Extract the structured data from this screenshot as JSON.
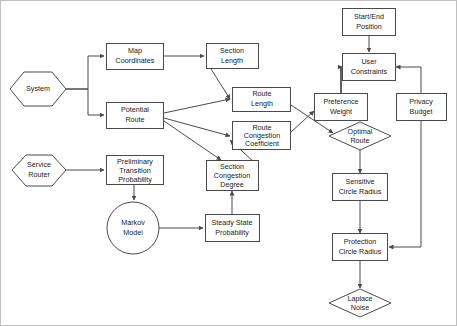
{
  "diagram": {
    "type": "flowchart",
    "background_color": "#ffffff",
    "stroke_color": "#4a4a4a",
    "text_color": "#1a1a1a",
    "border_color": "#bfbfbf",
    "nodes": [
      {
        "id": "system",
        "shape": "hexagon",
        "label": "System",
        "lines": [
          "System"
        ],
        "cx": 38,
        "cy": 89,
        "w": 56,
        "h": 34
      },
      {
        "id": "service_router",
        "shape": "hexagon",
        "label": "Service Router",
        "lines": [
          "Service",
          "Router"
        ],
        "cx": 39,
        "cy": 170,
        "w": 54,
        "h": 31
      },
      {
        "id": "map_coordinates",
        "shape": "rect",
        "label": "Map Coordinates",
        "lines": [
          "Map",
          "Coordinates"
        ],
        "cx": 135,
        "cy": 56,
        "w": 57,
        "h": 26
      },
      {
        "id": "potential_route",
        "shape": "rect",
        "label": "Potential Route",
        "lines": [
          "Potential",
          "Route"
        ],
        "cx": 135,
        "cy": 115,
        "w": 57,
        "h": 26
      },
      {
        "id": "section_length",
        "shape": "rect",
        "label": "Section Length",
        "lines": [
          "Section",
          "Length"
        ],
        "cx": 232,
        "cy": 56,
        "w": 52,
        "h": 25
      },
      {
        "id": "route_length",
        "shape": "rect",
        "label": "Route Length",
        "lines": [
          "Route",
          "Length"
        ],
        "cx": 262,
        "cy": 99,
        "w": 58,
        "h": 24
      },
      {
        "id": "route_congestion",
        "shape": "rect",
        "label": "Route Congestion Coefficient",
        "lines": [
          "Route",
          "Congestion",
          "Coefficient"
        ],
        "cx": 262,
        "cy": 136,
        "w": 58,
        "h": 28
      },
      {
        "id": "section_congestion",
        "shape": "rect",
        "label": "Section Congestion Degree",
        "lines": [
          "Section",
          "Congestion",
          "Degree"
        ],
        "cx": 232,
        "cy": 175,
        "w": 52,
        "h": 28
      },
      {
        "id": "prelim_transition",
        "shape": "rect",
        "label": "Preliminary Transition Probability",
        "lines": [
          "Preliminary",
          "Transition",
          "Probability"
        ],
        "cx": 135,
        "cy": 170,
        "w": 57,
        "h": 28
      },
      {
        "id": "markov_model",
        "shape": "circle",
        "label": "Markov Model",
        "lines": [
          "Markov",
          "Model"
        ],
        "cx": 133,
        "cy": 228,
        "w": 52,
        "h": 52
      },
      {
        "id": "steady_state",
        "shape": "rect",
        "label": "Steady State Probability",
        "lines": [
          "Steady State",
          "Probability"
        ],
        "cx": 232,
        "cy": 228,
        "w": 54,
        "h": 26
      },
      {
        "id": "start_end",
        "shape": "rect",
        "label": "Start/End Position",
        "lines": [
          "Start/End",
          "Position"
        ],
        "cx": 369,
        "cy": 22,
        "w": 52,
        "h": 27
      },
      {
        "id": "user_constraints",
        "shape": "rect",
        "label": "User Constraints",
        "lines": [
          "User",
          "Constraints"
        ],
        "cx": 369,
        "cy": 67,
        "w": 52,
        "h": 26
      },
      {
        "id": "preference_weight",
        "shape": "rect",
        "label": "Preference Weight",
        "lines": [
          "Preference",
          "Weight"
        ],
        "cx": 341,
        "cy": 107,
        "w": 53,
        "h": 26
      },
      {
        "id": "privacy_budget",
        "shape": "rect",
        "label": "Privacy Budget",
        "lines": [
          "Privacy",
          "Budget"
        ],
        "cx": 421,
        "cy": 107,
        "w": 50,
        "h": 26
      },
      {
        "id": "optimal_route",
        "shape": "diamond",
        "label": "Optimal Route",
        "lines": [
          "Optimal",
          "Route"
        ],
        "cx": 360,
        "cy": 136,
        "w": 62,
        "h": 28
      },
      {
        "id": "sensitive_radius",
        "shape": "rect",
        "label": "Sensitive Circle Radius",
        "lines": [
          "Sensitive",
          "Circle Radius"
        ],
        "cx": 360,
        "cy": 187,
        "w": 55,
        "h": 27
      },
      {
        "id": "protection_radius",
        "shape": "rect",
        "label": "Protection Circle Radius",
        "lines": [
          "Protection",
          "Circle Radius"
        ],
        "cx": 360,
        "cy": 247,
        "w": 55,
        "h": 27
      },
      {
        "id": "laplace_noise",
        "shape": "diamond",
        "label": "Laplace Noise",
        "lines": [
          "Laplace",
          "Noise"
        ],
        "cx": 360,
        "cy": 303,
        "w": 62,
        "h": 28
      }
    ],
    "edges": [
      {
        "from": "system",
        "to": "map_coordinates",
        "style": "orthogonal"
      },
      {
        "from": "system",
        "to": "potential_route",
        "style": "orthogonal"
      },
      {
        "from": "map_coordinates",
        "to": "section_length",
        "style": "straight"
      },
      {
        "from": "section_length",
        "to": "route_length",
        "style": "diagonal"
      },
      {
        "from": "potential_route",
        "to": "route_length",
        "style": "diagonal"
      },
      {
        "from": "potential_route",
        "to": "route_congestion",
        "style": "diagonal"
      },
      {
        "from": "potential_route",
        "to": "section_congestion",
        "style": "diagonal"
      },
      {
        "from": "section_congestion",
        "to": "route_congestion",
        "style": "diagonal"
      },
      {
        "from": "service_router",
        "to": "prelim_transition",
        "style": "straight"
      },
      {
        "from": "prelim_transition",
        "to": "markov_model",
        "style": "straight"
      },
      {
        "from": "markov_model",
        "to": "steady_state",
        "style": "straight"
      },
      {
        "from": "steady_state",
        "to": "section_congestion",
        "style": "straight"
      },
      {
        "from": "route_length",
        "to": "optimal_route",
        "style": "diagonal"
      },
      {
        "from": "route_congestion",
        "to": "preference_weight",
        "style": "diagonal"
      },
      {
        "from": "start_end",
        "to": "user_constraints",
        "style": "straight"
      },
      {
        "from": "preference_weight",
        "to": "user_constraints",
        "style": "orthogonal"
      },
      {
        "from": "privacy_budget",
        "to": "user_constraints",
        "style": "orthogonal"
      },
      {
        "from": "optimal_route",
        "to": "sensitive_radius",
        "style": "straight"
      },
      {
        "from": "sensitive_radius",
        "to": "protection_radius",
        "style": "straight"
      },
      {
        "from": "privacy_budget",
        "to": "protection_radius",
        "style": "orthogonal"
      },
      {
        "from": "protection_radius",
        "to": "laplace_noise",
        "style": "straight"
      }
    ]
  }
}
